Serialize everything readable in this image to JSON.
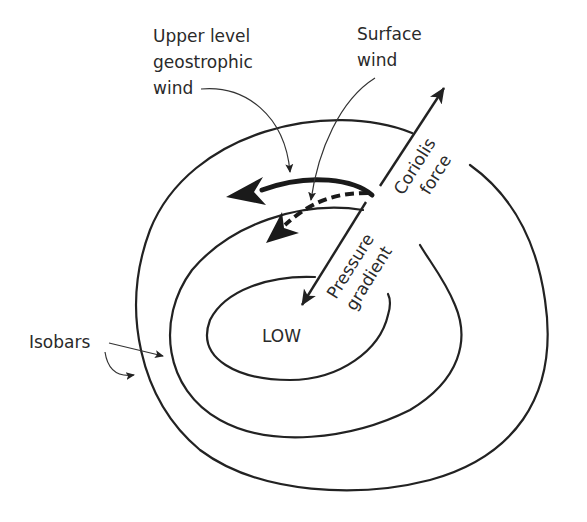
{
  "diagram": {
    "labels": {
      "upper_wind": [
        "Upper level",
        "geostrophic",
        "wind"
      ],
      "surface_wind": [
        "Surface",
        "wind"
      ],
      "coriolis": [
        "Coriolis",
        "force"
      ],
      "pressure": [
        "Pressure",
        "gradient"
      ],
      "low": "LOW",
      "isobars": "Isobars"
    },
    "elements": {
      "isobars": 3,
      "force_arrows": [
        "Coriolis force",
        "Pressure gradient"
      ],
      "wind_arrows": [
        {
          "name": "Upper level geostrophic wind",
          "style": "solid-thick"
        },
        {
          "name": "Surface wind",
          "style": "dashed"
        }
      ]
    },
    "colors": {
      "line": "#222222",
      "background": "#ffffff"
    }
  }
}
